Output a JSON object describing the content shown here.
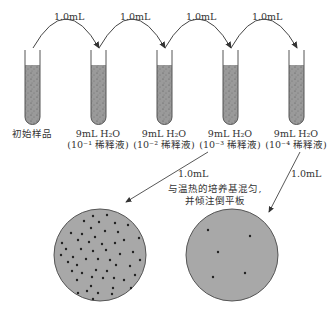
{
  "figure": {
    "transfer_volume": "1.0mL",
    "tubes": [
      {
        "label_line1": "初始样品",
        "label_line2": "",
        "x": 25
      },
      {
        "label_line1": "9mL H₂O",
        "label_line2": "(10⁻¹ 稀释液)",
        "x": 91
      },
      {
        "label_line1": "9mL H₂O",
        "label_line2": "(10⁻² 稀释液)",
        "x": 157
      },
      {
        "label_line1": "9mL H₂O",
        "label_line2": "(10⁻³ 稀释液)",
        "x": 223
      },
      {
        "label_line1": "9mL H₂O",
        "label_line2": "(10⁻⁴ 稀释液)",
        "x": 289
      }
    ],
    "arc_labels": [
      "1.0mL",
      "1.0mL",
      "1.0mL",
      "1.0mL"
    ],
    "plate_arrow_labels": [
      "1.0mL",
      "1.0mL"
    ],
    "plate_note_line1": "与温热的培养基混匀,",
    "plate_note_line2": "并倾注倒平板",
    "plates": [
      {
        "name": "plate-from-10^-3",
        "colony_count": "many"
      },
      {
        "name": "plate-from-10^-4",
        "colony_count": 5
      }
    ],
    "colors": {
      "liquid": "#9a9a9a",
      "plate": "#a6a6a6",
      "outline": "#555555",
      "colony": "#222222"
    }
  }
}
